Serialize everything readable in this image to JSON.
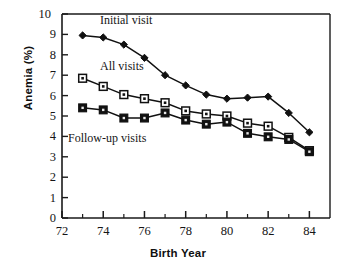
{
  "chart_data": {
    "type": "line",
    "title": "",
    "xlabel": "Birth Year",
    "ylabel": "Anemia (%)",
    "xlim": [
      72,
      85
    ],
    "ylim": [
      0,
      10
    ],
    "xticks": [
      "72",
      "74",
      "76",
      "78",
      "80",
      "82",
      "84"
    ],
    "xtick_values": [
      72,
      74,
      76,
      78,
      80,
      82,
      84
    ],
    "xminor_ticks": [
      73,
      75,
      77,
      79,
      81,
      83
    ],
    "yticks": [
      "0",
      "1",
      "2",
      "3",
      "4",
      "5",
      "6",
      "7",
      "8",
      "9",
      "10"
    ],
    "ytick_values": [
      0,
      1,
      2,
      3,
      4,
      5,
      6,
      7,
      8,
      9,
      10
    ],
    "grid": false,
    "legend_position": "in-plot-annotations",
    "x": [
      73,
      74,
      75,
      76,
      77,
      78,
      79,
      80,
      81,
      82,
      83,
      84
    ],
    "series": [
      {
        "name": "Initial visit",
        "marker": "filled-diamond",
        "color": "#111111",
        "values": [
          8.95,
          8.85,
          8.5,
          7.85,
          7.0,
          6.5,
          6.05,
          5.85,
          5.9,
          5.95,
          5.15,
          4.2
        ],
        "annotation": "Initial visit"
      },
      {
        "name": "All visits",
        "marker": "open-square-dot",
        "color": "#111111",
        "values": [
          6.85,
          6.45,
          6.05,
          5.85,
          5.65,
          5.25,
          5.1,
          5.0,
          4.65,
          4.5,
          3.95,
          3.3
        ],
        "annotation": "All visits"
      },
      {
        "name": "Follow-up visits",
        "marker": "filled-square",
        "color": "#111111",
        "values": [
          5.4,
          5.3,
          4.9,
          4.9,
          5.15,
          4.8,
          4.6,
          4.7,
          4.15,
          3.98,
          3.85,
          3.25
        ],
        "annotation": "Follow-up visits"
      }
    ],
    "annotations": [
      {
        "text": "Initial visit",
        "x_px": 100,
        "y_px": 14
      },
      {
        "text": "All visits",
        "x_px": 100,
        "y_px": 60
      },
      {
        "text": "Follow-up visits",
        "x_px": 68,
        "y_px": 132
      }
    ]
  }
}
